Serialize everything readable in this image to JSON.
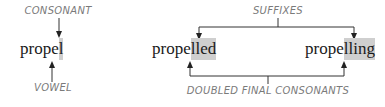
{
  "left": {
    "top_label": "CONSONANT",
    "word_plain": "prope",
    "word_highlight": "l",
    "bottom_label": "VOWEL"
  },
  "right": {
    "top_label": "SUFFIXES",
    "word1_plain": "prope",
    "word1_highlight": "lled",
    "word2_plain": "prope",
    "word2_highlight": "lling",
    "bottom_label": "DOUBLED FINAL CONSONANTS"
  },
  "colors": {
    "highlight": "#cfcfcf",
    "label": "#7a7a7a",
    "line": "#333333",
    "text": "#1a1a1a"
  }
}
